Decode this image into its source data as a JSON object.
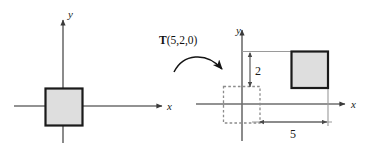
{
  "figure": {
    "type": "geometry-diagram",
    "transform_label": {
      "operator": "T",
      "arguments": "(5,2,0)",
      "full": "T(5,2,0)"
    },
    "colors": {
      "axis": "#6e6e6e",
      "square_stroke": "#1a1a1a",
      "square_fill": "#dedede",
      "ghost_stroke": "#8c8c8c",
      "dimension_line": "#7a7a7a",
      "text": "#111111",
      "background": "#ffffff"
    },
    "left_panel": {
      "name": "original-position",
      "axes": {
        "x_label": "x",
        "y_label": "y",
        "origin_px": {
          "x": 63,
          "y": 106
        }
      },
      "square": {
        "name": "original-square",
        "style": "solid",
        "fill": "#dedede",
        "centered_on_origin": true,
        "bounds_px": {
          "x": 45,
          "y": 88,
          "width": 37,
          "height": 37
        }
      }
    },
    "arrow": {
      "name": "transform-arrow",
      "style": "curved",
      "direction": "left-to-right"
    },
    "right_panel": {
      "name": "translated-position",
      "axes": {
        "x_label": "x",
        "y_label": "y",
        "origin_px": {
          "x": 242,
          "y": 104
        }
      },
      "ghost_square": {
        "name": "ghost-square",
        "style": "dashed",
        "fill": "none",
        "bounds_px": {
          "x": 223,
          "y": 86,
          "width": 37,
          "height": 37
        }
      },
      "translated_square": {
        "name": "translated-square",
        "style": "solid",
        "fill": "#dedede",
        "bounds_px": {
          "x": 291,
          "y": 51,
          "width": 37,
          "height": 37
        }
      },
      "dimensions": [
        {
          "name": "vertical-dimension",
          "label": "2",
          "orientation": "vertical",
          "value": 2
        },
        {
          "name": "horizontal-dimension",
          "label": "5",
          "orientation": "horizontal",
          "value": 5
        }
      ]
    }
  }
}
